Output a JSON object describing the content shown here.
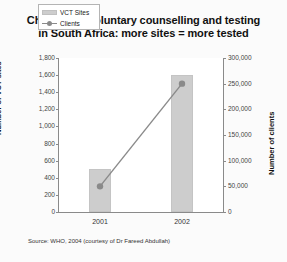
{
  "figure": {
    "title_line1": "Changes in voluntary counselling and testing",
    "title_line2": "in South Africa: more sites = more tested",
    "source": "Source: WHO, 2004 (courtesy of Dr Fareed Abdullah)"
  },
  "legend": {
    "bar_label": "VCT Sites",
    "line_label": "Clients"
  },
  "chart_data": {
    "type": "bar",
    "title": "Changes in voluntary counselling and testing in South Africa: more sites = more tested",
    "xlabel": "",
    "categories": [
      "2001",
      "2002"
    ],
    "grid": false,
    "legend_position": "top-left",
    "series": [
      {
        "name": "VCT Sites",
        "type": "bar",
        "axis": "left",
        "values": [
          500,
          1600
        ],
        "color": "#cdcdcd"
      },
      {
        "name": "Clients",
        "type": "line",
        "axis": "right",
        "values": [
          50000,
          250000
        ],
        "color": "#8a8a8a"
      }
    ],
    "yaxis_left": {
      "label": "Number of VCT sites",
      "min": 0,
      "max": 1800,
      "step": 200,
      "ticks": [
        "0",
        "200",
        "400",
        "600",
        "800",
        "1,000",
        "1,200",
        "1,400",
        "1,600",
        "1,800"
      ]
    },
    "yaxis_right": {
      "label": "Number of clients",
      "min": 0,
      "max": 300000,
      "step": 50000,
      "ticks": [
        "0",
        "50,000",
        "100,000",
        "150,000",
        "200,000",
        "250,000",
        "300,000"
      ]
    }
  }
}
